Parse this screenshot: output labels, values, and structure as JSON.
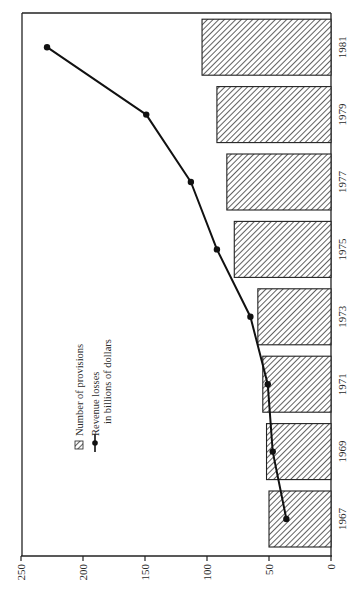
{
  "chart_data": {
    "type": "bar",
    "orientation": "rotated-90-ccw (horizontal bars, value axis along bottom increasing to the left)",
    "title": "",
    "xlabel": "",
    "ylabel": "",
    "categories": [
      "1967",
      "1969",
      "1971",
      "1973",
      "1975",
      "1977",
      "1979",
      "1981"
    ],
    "series": [
      {
        "name": "Number of provisions",
        "kind": "bar",
        "pattern": "diagonal-hatch",
        "values": [
          50,
          52,
          55,
          59,
          78,
          84,
          92,
          104
        ]
      },
      {
        "name": "Revenue losses in billions of dollars",
        "kind": "line",
        "marker": "filled-circle",
        "values": [
          36,
          47,
          51,
          65,
          92,
          113,
          149,
          229
        ]
      }
    ],
    "value_axis": {
      "ticks": [
        0,
        50,
        100,
        150,
        200,
        250
      ],
      "range": [
        0,
        250
      ]
    },
    "grid": false,
    "legend": {
      "position": "inside, upper-left of plot (rotated)",
      "entries": [
        {
          "symbol": "hatched-square",
          "label": "Number of provisions"
        },
        {
          "symbol": "line-with-dot",
          "label": "Revenue losses",
          "label_line2": "in billions of dollars"
        }
      ]
    },
    "colors": {
      "bar_fill": "#ffffff",
      "hatch": "#3a3a3a",
      "line": "#111111",
      "axis": "#222222"
    }
  }
}
